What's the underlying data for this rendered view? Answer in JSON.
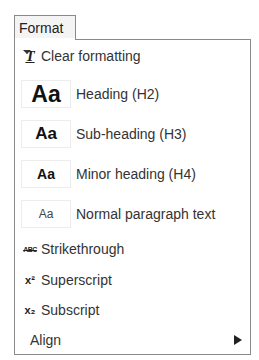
{
  "toolbar": {
    "format_label": "Format",
    "format_caret_icon": "caret-down-icon"
  },
  "menu": {
    "clear_formatting": {
      "label": "Clear formatting",
      "icon": "clear-formatting-icon",
      "icon_glyph": "T̶"
    },
    "headings": [
      {
        "label": "Heading (H2)",
        "preview": "Aa",
        "icon": "heading-h2-preview"
      },
      {
        "label": "Sub-heading (H3)",
        "preview": "Aa",
        "icon": "heading-h3-preview"
      },
      {
        "label": "Minor heading (H4)",
        "preview": "Aa",
        "icon": "heading-h4-preview"
      },
      {
        "label": "Normal paragraph text",
        "preview": "Aa",
        "icon": "paragraph-preview"
      }
    ],
    "strikethrough": {
      "label": "Strikethrough",
      "icon": "strikethrough-icon",
      "icon_glyph": "ABC"
    },
    "superscript": {
      "label": "Superscript",
      "icon": "superscript-icon",
      "icon_glyph": "x²"
    },
    "subscript": {
      "label": "Subscript",
      "icon": "subscript-icon",
      "icon_glyph": "x₂"
    },
    "align": {
      "label": "Align",
      "icon": "submenu-arrow-icon"
    }
  }
}
